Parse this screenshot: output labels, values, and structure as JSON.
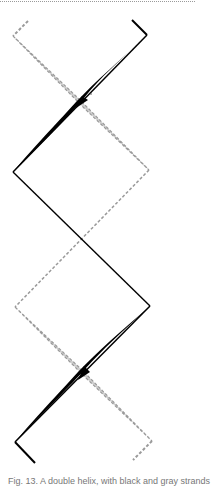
{
  "figure": {
    "type": "double-helix ribbon diagram",
    "strands": [
      {
        "name": "solid-strand",
        "style": "solid",
        "color": "#000000",
        "points": [
          [
            132,
            20
          ],
          [
            147,
            35
          ],
          [
            13,
            172
          ],
          [
            150,
            306
          ],
          [
            15,
            442
          ],
          [
            35,
            463
          ]
        ]
      },
      {
        "name": "dashed-strand",
        "style": "dashed",
        "color": "#9a9a9a",
        "fill": "#cfcfcf",
        "points": [
          [
            28,
            21
          ],
          [
            13,
            36
          ],
          [
            149,
            170
          ],
          [
            15,
            307
          ],
          [
            152,
            441
          ],
          [
            133,
            460
          ]
        ]
      }
    ],
    "crossings": [
      [
        80,
        104
      ],
      [
        82,
        238
      ],
      [
        82,
        374
      ]
    ]
  },
  "caption": {
    "text": "Fig. 13. A double helix, with black and gray strands"
  },
  "colors": {
    "solid": "#000000",
    "dashed": "#9a9a9a",
    "ribbon_fill": "#cfcfcf",
    "border": "#9a9a9a"
  }
}
